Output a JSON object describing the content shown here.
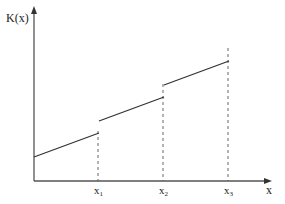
{
  "chart_data": {
    "type": "line",
    "title": "",
    "xlabel": "x",
    "ylabel": "K(x)",
    "x_ticks": [
      {
        "base": "x",
        "sub": "1"
      },
      {
        "base": "x",
        "sub": "2"
      },
      {
        "base": "x",
        "sub": "3"
      }
    ],
    "grid": false,
    "legend": null,
    "series": [
      {
        "name": "K(x)",
        "segments": [
          {
            "x": [
              0,
              1
            ],
            "y": [
              0.2,
              0.4
            ]
          },
          {
            "x": [
              1,
              2
            ],
            "y": [
              0.5,
              0.7
            ]
          },
          {
            "x": [
              2,
              3
            ],
            "y": [
              0.8,
              1.0
            ]
          }
        ]
      }
    ],
    "xlim": [
      0,
      3.6
    ],
    "ylim": [
      0,
      1.15
    ],
    "colors": {
      "line": "#333333",
      "axis": "#555555",
      "dashed": "#555555"
    }
  }
}
